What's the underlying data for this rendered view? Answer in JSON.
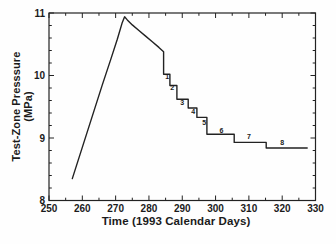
{
  "chart_data": {
    "type": "line",
    "title": "",
    "xlabel": "Time (1993 Calendar Days)",
    "ylabel": "Test-Zone Presssure (MPa)",
    "xlim": [
      250,
      330
    ],
    "ylim": [
      8,
      11
    ],
    "x_major_ticks": [
      250,
      260,
      270,
      280,
      290,
      300,
      310,
      320,
      330
    ],
    "x_minor_interval": 5,
    "y_major_ticks": [
      8,
      9,
      10,
      11
    ],
    "y_minor_interval": 0.2,
    "grid": false,
    "legend": "none",
    "line_color": "#222222",
    "series": [
      {
        "name": "test-zone pressure",
        "points": [
          [
            257.0,
            8.35
          ],
          [
            260.0,
            8.85
          ],
          [
            263.0,
            9.35
          ],
          [
            266.0,
            9.85
          ],
          [
            268.5,
            10.25
          ],
          [
            270.5,
            10.58
          ],
          [
            272.0,
            10.85
          ],
          [
            272.7,
            10.94
          ],
          [
            273.5,
            10.89
          ],
          [
            275.0,
            10.81
          ],
          [
            277.0,
            10.72
          ],
          [
            279.0,
            10.63
          ],
          [
            281.0,
            10.54
          ],
          [
            283.0,
            10.45
          ],
          [
            284.4,
            10.38
          ],
          [
            284.4,
            10.02
          ],
          [
            286.3,
            10.02
          ],
          [
            286.3,
            9.84
          ],
          [
            288.4,
            9.84
          ],
          [
            288.4,
            9.62
          ],
          [
            291.8,
            9.62
          ],
          [
            291.8,
            9.48
          ],
          [
            294.4,
            9.48
          ],
          [
            294.4,
            9.33
          ],
          [
            297.4,
            9.33
          ],
          [
            297.4,
            9.06
          ],
          [
            305.6,
            9.06
          ],
          [
            305.6,
            8.93
          ],
          [
            315.2,
            8.93
          ],
          [
            315.2,
            8.84
          ],
          [
            327.5,
            8.84
          ]
        ]
      }
    ],
    "step_labels": [
      {
        "text": "1",
        "x": 285.5,
        "y": 9.98
      },
      {
        "text": "2",
        "x": 287.0,
        "y": 9.8
      },
      {
        "text": "3",
        "x": 290.0,
        "y": 9.56
      },
      {
        "text": "4",
        "x": 293.3,
        "y": 9.42
      },
      {
        "text": "5",
        "x": 296.6,
        "y": 9.25
      },
      {
        "text": "6",
        "x": 301.8,
        "y": 9.12
      },
      {
        "text": "7",
        "x": 310.0,
        "y": 9.03
      },
      {
        "text": "8",
        "x": 320.0,
        "y": 8.92
      }
    ]
  }
}
